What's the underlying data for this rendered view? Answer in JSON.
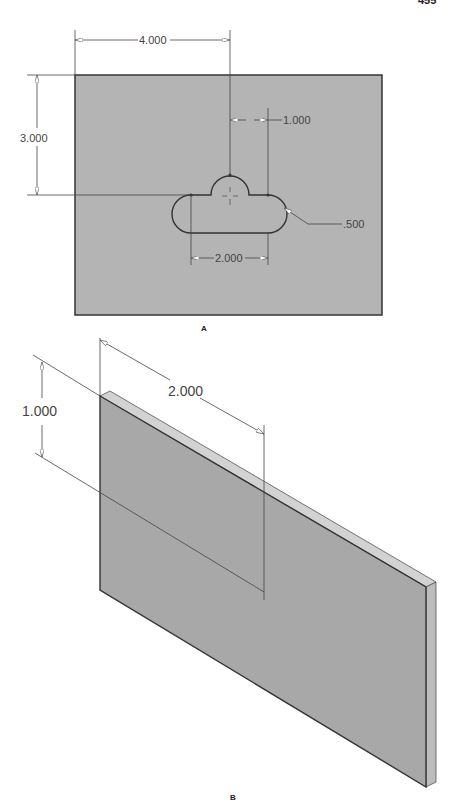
{
  "page": {
    "number": "455"
  },
  "figure_a": {
    "label": "A",
    "plate_color": "#b4b4b4",
    "dimensions": {
      "width": "4.000",
      "height": "3.000",
      "offset": "1.000",
      "slot_length": "2.000",
      "radius": ".500"
    }
  },
  "figure_b": {
    "label": "B",
    "face_color": "#a8a8a8",
    "top_edge_color": "#d2d2d2",
    "side_edge_color": "#bcbcbc",
    "dimensions": {
      "depth": "1.000",
      "length": "2.000"
    }
  }
}
